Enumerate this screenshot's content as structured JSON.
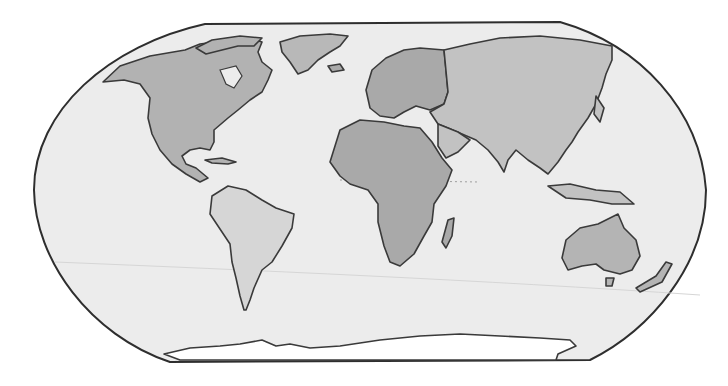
{
  "map": {
    "projection": "Robinson-like world map",
    "style": "grayscale",
    "colors": {
      "ocean": "#ececec",
      "outline": "#2e2e2e",
      "coastline": "#3a3a3a",
      "ice": "#ffffff"
    },
    "regions": [
      {
        "id": "north-america",
        "name": "North America",
        "fill": "#b2b2b2"
      },
      {
        "id": "greenland",
        "name": "Greenland",
        "fill": "#b8b8b8"
      },
      {
        "id": "south-america",
        "name": "South America",
        "fill": "#d6d6d6"
      },
      {
        "id": "europe",
        "name": "Europe",
        "fill": "#a9a9a9"
      },
      {
        "id": "africa",
        "name": "Africa",
        "fill": "#a9a9a9"
      },
      {
        "id": "asia",
        "name": "Asia",
        "fill": "#c2c2c2"
      },
      {
        "id": "australia",
        "name": "Australia",
        "fill": "#b4b4b4"
      },
      {
        "id": "antarctica",
        "name": "Antarctica",
        "fill": "#ffffff"
      }
    ]
  }
}
